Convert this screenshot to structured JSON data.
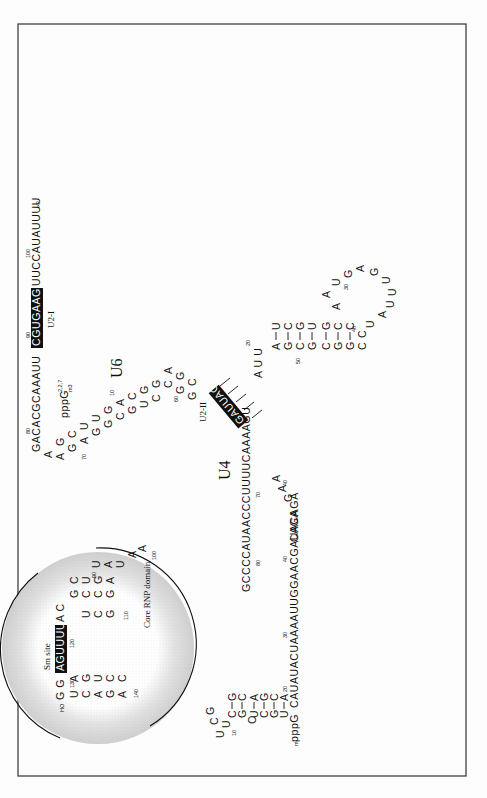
{
  "figure": {
    "frame_color": "#333333",
    "highlight_color": "#111111",
    "shade_color": "#d9d9d9",
    "labels": {
      "u6": "U6",
      "u4": "U4",
      "u2_i": "U2-I",
      "u2_ii": "U2-II",
      "sm_site": "Sm site",
      "core_rnp": "Core RNP domain"
    },
    "u6": {
      "three_prime_tail": "UUCCAUAUUUU",
      "three_prime_end": ">P",
      "u2_i_box": "CGUGAAGCG",
      "segment_80_90": "GACACGCAAAUU",
      "cap": "pppG",
      "cap_sub": "m3",
      "cap_sup": "2,2,7",
      "five_prime_stem_left": [
        "A",
        "U",
        "G",
        "C",
        "A",
        "C",
        "C",
        "C",
        "C"
      ],
      "five_prime_stem_right": [
        "A",
        "G",
        "U",
        "U",
        "G",
        "G",
        "A",
        "G",
        "C"
      ],
      "u2_ii_box": "GAUUAG",
      "linker_40": "UUGGAACGAUACAGAGAA",
      "numbers": [
        "100",
        "90",
        "80",
        "70",
        "60",
        "50",
        "40",
        "30",
        "20",
        "10"
      ]
    },
    "u4": {
      "five_prime": "CAUAUACUAAAAUUGGAACGAUACAGA",
      "cap": "mpppG",
      "top_hairpin": [
        "U",
        "C",
        "G",
        "U",
        "C",
        "G",
        "C",
        "U",
        "C"
      ],
      "stem_3": "GCCCCAUAACCCUUUUCAAAAGU",
      "hairpin_left": [
        "A",
        "G",
        "C",
        "G",
        "C",
        "C"
      ],
      "hairpin_right": [
        "U",
        "C",
        "G",
        "U",
        "G",
        "G"
      ],
      "loop": "AUGAGUUUUAUCC",
      "sm_site_box": "AGUUUUUA",
      "three_prime": "HO",
      "numbers": [
        "10",
        "20",
        "30",
        "40",
        "60",
        "70",
        "80",
        "90",
        "100",
        "110",
        "120",
        "130",
        "140"
      ]
    }
  }
}
